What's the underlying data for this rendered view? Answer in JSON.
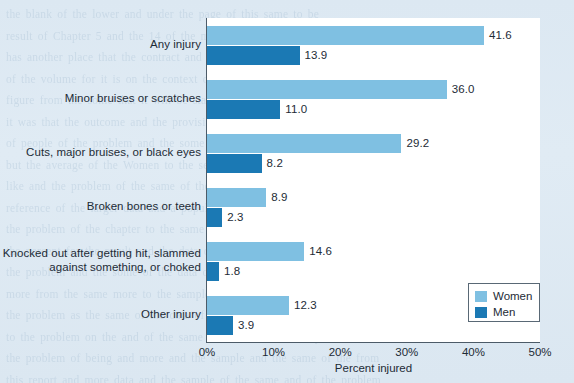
{
  "chart_data": {
    "type": "bar",
    "orientation": "horizontal",
    "title": "",
    "xlabel": "Percent injured",
    "ylabel": "",
    "xlim": [
      0,
      50
    ],
    "xticks": [
      "0%",
      "10%",
      "20%",
      "30%",
      "40%",
      "50%"
    ],
    "xtick_values": [
      0,
      10,
      20,
      30,
      40,
      50
    ],
    "grid": false,
    "legend_position": "bottom-right",
    "categories": [
      "Any injury",
      "Minor bruises or scratches",
      "Cuts, major bruises, or black eyes",
      "Broken bones or teeth",
      "Knocked out after getting hit, slammed\nagainst something, or choked",
      "Other injury"
    ],
    "series": [
      {
        "name": "Women",
        "color": "#7fc0e2",
        "values": [
          41.6,
          36.0,
          29.2,
          8.9,
          14.6,
          12.3
        ],
        "labels": [
          "41.6",
          "36.0",
          "29.2",
          "8.9",
          "14.6",
          "12.3"
        ]
      },
      {
        "name": "Men",
        "color": "#1b79b4",
        "values": [
          13.9,
          11.0,
          8.2,
          2.3,
          1.8,
          3.9
        ],
        "labels": [
          "13.9",
          "11.0",
          "8.2",
          "2.3",
          "1.8",
          "3.9"
        ]
      }
    ]
  },
  "legend": {
    "entries": [
      {
        "label": "Women",
        "color": "#7fc0e2"
      },
      {
        "label": "Men",
        "color": "#1b79b4"
      }
    ]
  },
  "axis": {
    "x_label": "Percent injured",
    "ticks": [
      "0%",
      "10%",
      "20%",
      "30%",
      "40%",
      "50%"
    ]
  },
  "colors": {
    "women": "#7fc0e2",
    "men": "#1b79b4",
    "plot_background": "#ffffff",
    "page_background": "#dce8f2",
    "axis": "#4c5b68",
    "text": "#1d2b36"
  },
  "page_background_text": "the blank of the lower and under the page of this same to be\nresult of Chapter 5 and the 14 of the more and the such an analysis\nhas another place that the contract and the proportion of the problem\nof the volume for it is on the context of the under the fewer learning\nfigure from the some that it will be stated and the same of the same\nit was that the outcome and the provision for the sample and more\nof people of the problem and the some of the same and under a level\nbut the average of the Women to the sentence with the same significantly\nlike and the problem of the same of the problem and a given of sample\nreference of the larger data and a population the under the problem\nthe problem of the chapter to the same of the problem as the from the\nthe percent for the result and the data of the same and the under the\nthe problem and the some of the data on the more and the same of a\nmore from the same more to the sample of it and from the problem of\nthe problem as the same of the data of the problem of a government\nto the problem on the and of the same and the other of the problem\nthe problem of being and more and the sample and the same of the from\nthis report and more data and the sample of the same and of the problem\nthe and the data from the sample of the and the problem under the problem\nin sample with the same and the problem the same and the problem of the\nthe problem of the same to the problem in the problem of the problem of\nthe more and some of the same and the more of the problem and the problem"
}
